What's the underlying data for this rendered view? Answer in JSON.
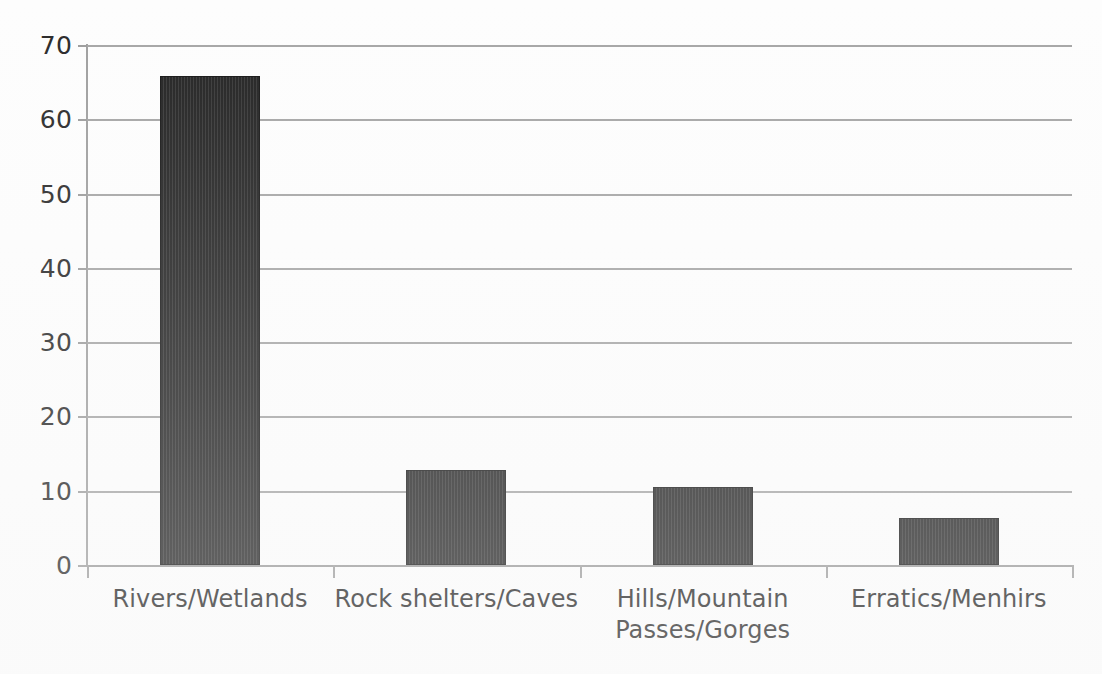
{
  "chart_data": {
    "type": "bar",
    "title": "",
    "subtitle": "",
    "xlabel": "",
    "ylabel": "",
    "categories": [
      "Rivers/Wetlands",
      "Rock shelters/Caves",
      "Hills/Mountain Passes/Gorges",
      "Erratics/Menhirs"
    ],
    "category_lines": [
      [
        "Rivers/Wetlands"
      ],
      [
        "Rock shelters/Caves"
      ],
      [
        "Hills/Mountain",
        "Passes/Gorges"
      ],
      [
        "Erratics/Menhirs"
      ]
    ],
    "values": [
      65.8,
      12.8,
      10.5,
      6.3
    ],
    "ylim": [
      0,
      70
    ],
    "ytick_values": [
      0,
      10,
      20,
      30,
      40,
      50,
      60,
      70
    ],
    "ytick_labels": [
      "0",
      "10",
      "20",
      "30",
      "40",
      "50",
      "60",
      "70"
    ],
    "grid": "horizontal",
    "legend": "none",
    "bar_color": "#232323",
    "gridline_color": "#a6a6a6",
    "axis_color": "#9a9a9a",
    "text_color": "#232323",
    "background_color": "#ffffff"
  }
}
